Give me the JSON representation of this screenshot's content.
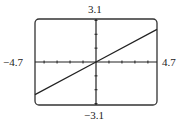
{
  "chart_data": {
    "type": "line",
    "title": "",
    "xlabel": "",
    "ylabel": "",
    "xlim": [
      -4.7,
      4.7
    ],
    "ylim": [
      -3.1,
      3.1
    ],
    "xtick_step": 1,
    "ytick_step": 1,
    "grid": false,
    "legend": null,
    "window_labels": {
      "ymax": "3.1",
      "ymin": "−3.1",
      "xmin": "−4.7",
      "xmax": "4.7"
    },
    "series": [
      {
        "name": "y = 0.5x",
        "x": [
          -4.7,
          0,
          4.7
        ],
        "y": [
          -2.35,
          0,
          2.35
        ]
      }
    ]
  },
  "colors": {
    "frame": "#333333",
    "axes": "#222222",
    "line": "#222222"
  }
}
